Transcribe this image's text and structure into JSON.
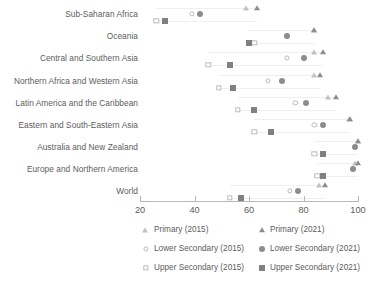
{
  "chart_data": {
    "type": "scatter",
    "title": "",
    "subtitle": "",
    "xlabel": "",
    "ylabel": "",
    "xlim": [
      20,
      104
    ],
    "xticks": [
      20,
      40,
      60,
      80,
      100
    ],
    "xticklabels": [
      "20",
      "40",
      "60",
      "80",
      "100"
    ],
    "grid": false,
    "legend_position": "bottom",
    "categories": [
      "Sub-Saharan Africa",
      "Oceania",
      "Central and Southern Asia",
      "Northern Africa and Western Asia",
      "Latin America and the Caribbean",
      "Eastern and South-Eastern Asia",
      "Australia and New Zealand",
      "Europe and Northern America",
      "World"
    ],
    "series": [
      {
        "name": "Primary (2015)",
        "marker": "triangle-open",
        "color": "#bfc1c4",
        "values": [
          59,
          84,
          84,
          84,
          89,
          97,
          100,
          99,
          86
        ]
      },
      {
        "name": "Primary (2021)",
        "marker": "triangle-filled",
        "color": "#8a8c8f",
        "values": [
          63,
          84,
          87,
          86,
          92,
          97,
          100,
          100,
          88
        ]
      },
      {
        "name": "Lower Secondary (2015)",
        "marker": "circle-open",
        "color": "#b9bbbe",
        "values": [
          39,
          74,
          74,
          67,
          77,
          84,
          99,
          98,
          75
        ]
      },
      {
        "name": "Lower Secondary (2021)",
        "marker": "circle-filled",
        "color": "#8a8c8f",
        "values": [
          42,
          74,
          80,
          72,
          81,
          87,
          99,
          98,
          78
        ]
      },
      {
        "name": "Upper Secondary (2015)",
        "marker": "square-open",
        "color": "#b9bbbe",
        "values": [
          26,
          62,
          45,
          49,
          56,
          62,
          84,
          85,
          53
        ]
      },
      {
        "name": "Upper Secondary (2021)",
        "marker": "square-filled",
        "color": "#7e8084",
        "values": [
          29,
          60,
          53,
          54,
          62,
          68,
          87,
          87,
          57
        ]
      }
    ]
  },
  "legend": {
    "items": [
      {
        "label": "Primary (2015)",
        "marker": "triangle-open"
      },
      {
        "label": "Primary (2021)",
        "marker": "triangle-filled"
      },
      {
        "label": "Lower Secondary (2015)",
        "marker": "circle-open"
      },
      {
        "label": "Lower Secondary (2021)",
        "marker": "circle-filled"
      },
      {
        "label": "Upper Secondary (2015)",
        "marker": "square-open"
      },
      {
        "label": "Upper Secondary (2021)",
        "marker": "square-filled"
      }
    ]
  }
}
